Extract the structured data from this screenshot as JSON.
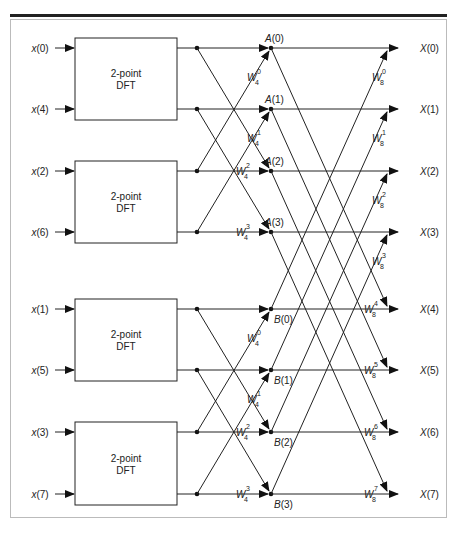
{
  "figure": {
    "inputs": [
      {
        "label": "x(0)",
        "sym": "x",
        "idx": "(0)"
      },
      {
        "label": "x(4)",
        "sym": "x",
        "idx": "(4)"
      },
      {
        "label": "x(2)",
        "sym": "x",
        "idx": "(2)"
      },
      {
        "label": "x(6)",
        "sym": "x",
        "idx": "(6)"
      },
      {
        "label": "x(1)",
        "sym": "x",
        "idx": "(1)"
      },
      {
        "label": "x(5)",
        "sym": "x",
        "idx": "(5)"
      },
      {
        "label": "x(3)",
        "sym": "x",
        "idx": "(3)"
      },
      {
        "label": "x(7)",
        "sym": "x",
        "idx": "(7)"
      }
    ],
    "blocks": [
      {
        "line1": "2-point",
        "line2": "DFT"
      },
      {
        "line1": "2-point",
        "line2": "DFT"
      },
      {
        "line1": "2-point",
        "line2": "DFT"
      },
      {
        "line1": "2-point",
        "line2": "DFT"
      }
    ],
    "nodes": [
      {
        "sym": "A",
        "idx": "(0)"
      },
      {
        "sym": "A",
        "idx": "(1)"
      },
      {
        "sym": "A",
        "idx": "(2)"
      },
      {
        "sym": "A",
        "idx": "(3)"
      },
      {
        "sym": "B",
        "idx": "(0)"
      },
      {
        "sym": "B",
        "idx": "(1)"
      },
      {
        "sym": "B",
        "idx": "(2)"
      },
      {
        "sym": "B",
        "idx": "(3)"
      }
    ],
    "stage1_twiddles": [
      {
        "base": "W",
        "sub": "4",
        "sup": "0"
      },
      {
        "base": "W",
        "sub": "4",
        "sup": "1"
      },
      {
        "base": "W",
        "sub": "4",
        "sup": "2"
      },
      {
        "base": "W",
        "sub": "4",
        "sup": "3"
      },
      {
        "base": "W",
        "sub": "4",
        "sup": "0"
      },
      {
        "base": "W",
        "sub": "4",
        "sup": "1"
      },
      {
        "base": "W",
        "sub": "4",
        "sup": "2"
      },
      {
        "base": "W",
        "sub": "4",
        "sup": "3"
      }
    ],
    "stage2_twiddles": [
      {
        "base": "W",
        "sub": "8",
        "sup": "0"
      },
      {
        "base": "W",
        "sub": "8",
        "sup": "1"
      },
      {
        "base": "W",
        "sub": "8",
        "sup": "2"
      },
      {
        "base": "W",
        "sub": "8",
        "sup": "3"
      },
      {
        "base": "W",
        "sub": "8",
        "sup": "4"
      },
      {
        "base": "W",
        "sub": "8",
        "sup": "5"
      },
      {
        "base": "W",
        "sub": "8",
        "sup": "6"
      },
      {
        "base": "W",
        "sub": "8",
        "sup": "7"
      }
    ],
    "outputs": [
      {
        "label": "X(0)"
      },
      {
        "label": "X(1)"
      },
      {
        "label": "X(2)"
      },
      {
        "label": "X(3)"
      },
      {
        "label": "X(4)"
      },
      {
        "label": "X(5)"
      },
      {
        "label": "X(6)"
      },
      {
        "label": "X(7)"
      }
    ]
  }
}
